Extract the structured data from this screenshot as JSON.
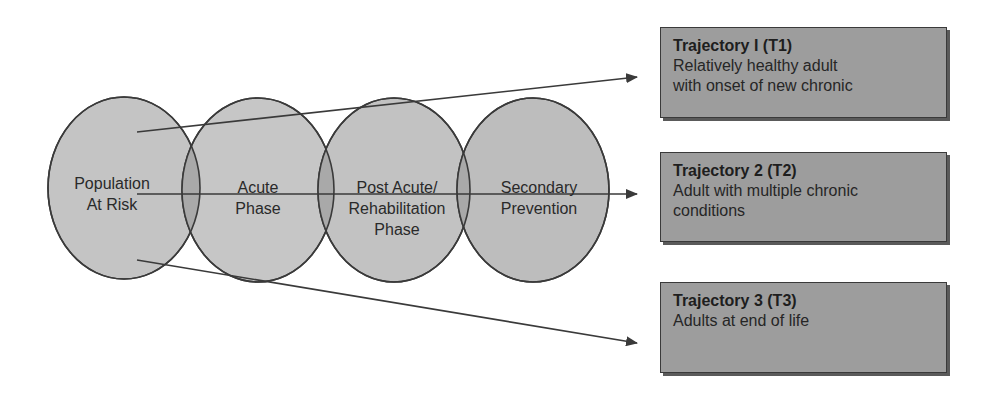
{
  "phases": [
    {
      "id": "population",
      "line1": "Population",
      "line2": "At Risk"
    },
    {
      "id": "acute",
      "line1": "Acute",
      "line2": "Phase"
    },
    {
      "id": "post-acute",
      "line1": "Post Acute/",
      "line2": "Rehabilitation",
      "line3": "Phase"
    },
    {
      "id": "secondary",
      "line1": "Secondary",
      "line2": "Prevention"
    }
  ],
  "trajectories": [
    {
      "title": "Trajectory I (T1)",
      "desc_line1": "Relatively healthy adult",
      "desc_line2": "with onset of new chronic"
    },
    {
      "title": "Trajectory 2 (T2)",
      "desc_line1": "Adult with multiple chronic",
      "desc_line2": "conditions"
    },
    {
      "title": "Trajectory 3 (T3)",
      "desc_line1": "Adults at end of life"
    }
  ],
  "colors": {
    "circle_fill": "#c4c4c4",
    "overlap_fill": "#a8a8a8",
    "box_fill": "#9d9d9d",
    "stroke": "#3a3a3a"
  }
}
